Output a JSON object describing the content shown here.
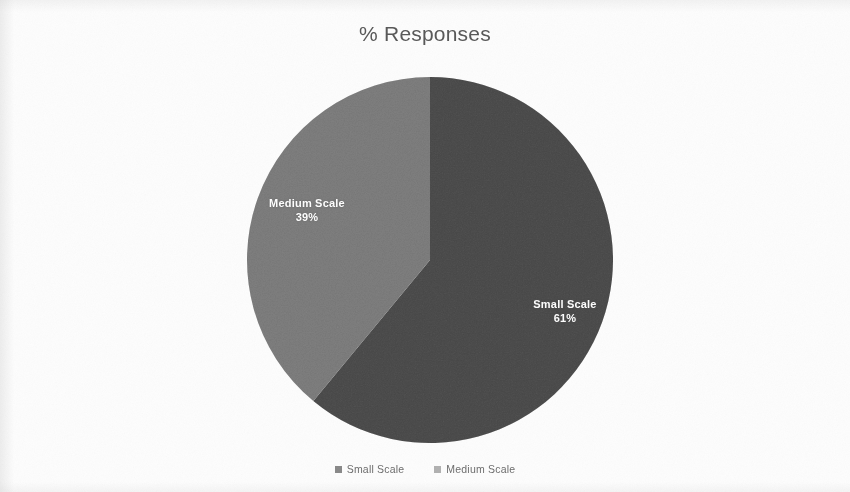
{
  "chart_data": {
    "type": "pie",
    "title": "% Responses",
    "categories": [
      "Small Scale",
      "Medium Scale"
    ],
    "values": [
      61,
      39
    ],
    "unit": "%",
    "slices": [
      {
        "label": "Small Scale",
        "value": 61,
        "value_label": "61%",
        "color": "#8a8a8a",
        "start_angle_deg": 0,
        "sweep_deg": 219.6
      },
      {
        "label": "Medium Scale",
        "value": 39,
        "value_label": "39%",
        "color": "#b2b2b2",
        "start_angle_deg": 219.6,
        "sweep_deg": 140.4
      }
    ],
    "legend": {
      "position": "bottom",
      "entries": [
        {
          "label": "Small Scale",
          "color": "#8a8a8a"
        },
        {
          "label": "Medium Scale",
          "color": "#b2b2b2"
        }
      ]
    },
    "data_labels": {
      "show_category": true,
      "show_percent": true,
      "text_color": "#ffffff"
    },
    "grid": false,
    "xlabel": "",
    "ylabel": ""
  },
  "title": {
    "text": "% Responses"
  },
  "labels": {
    "medium": {
      "name": "Medium Scale",
      "value": "39%"
    },
    "small": {
      "name": "Small Scale",
      "value": "61%"
    }
  },
  "legend": {
    "items": [
      {
        "label": "Small Scale"
      },
      {
        "label": "Medium Scale"
      }
    ]
  },
  "colors": {
    "background": "#fdfdfd",
    "small_scale": "#8a8a8a",
    "medium_scale": "#b2b2b2",
    "title_text": "#595959",
    "legend_text": "#6e6e6e",
    "label_text": "#ffffff"
  }
}
